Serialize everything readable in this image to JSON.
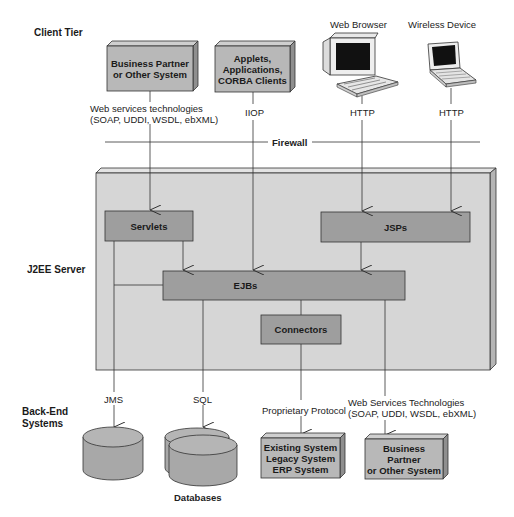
{
  "tiers": {
    "client": "Client Tier",
    "server": "J2EE Server",
    "backend_line1": "Back-End",
    "backend_line2": "Systems"
  },
  "clients": {
    "business_partner": {
      "line1": "Business Partner",
      "line2": "or Other System"
    },
    "applets": {
      "line1": "Applets,",
      "line2": "Applications,",
      "line3": "CORBA Clients"
    },
    "web_browser": "Web Browser",
    "wireless_device": "Wireless Device"
  },
  "protocols": {
    "web_services_line1": "Web services technologies",
    "web_services_line2": "(SOAP, UDDI, WSDL, ebXML)",
    "iiop": "IIOP",
    "http_browser": "HTTP",
    "http_wireless": "HTTP",
    "firewall": "Firewall",
    "jms": "JMS",
    "sql": "SQL",
    "proprietary": "Proprietary Protocol",
    "ws_backend_line1": "Web Services Technologies",
    "ws_backend_line2": "(SOAP, UDDI, WSDL, ebXML)"
  },
  "server_components": {
    "servlets": "Servlets",
    "jsps": "JSPs",
    "ejbs": "EJBs",
    "connectors": "Connectors"
  },
  "backend": {
    "databases": "Databases",
    "existing": {
      "line1": "Existing System",
      "line2": "Legacy System",
      "line3": "ERP System"
    },
    "partner": {
      "line1": "Business",
      "line2": "Partner",
      "line3": "or Other System"
    }
  },
  "colors": {
    "server_face": "#d6d6d6",
    "server_edge": "#bdbdbd",
    "component_fill": "#9e9e9e",
    "box_fill": "#b8b8b8",
    "box_edge": "#a0a0a0",
    "line": "#333333"
  }
}
